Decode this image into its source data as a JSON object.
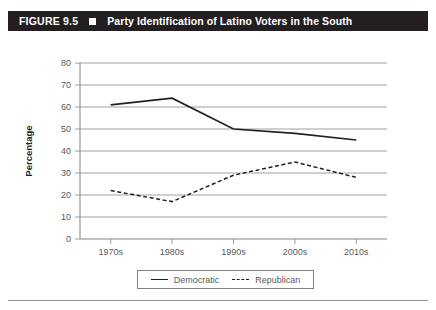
{
  "figure": {
    "number_label": "FIGURE 9.5",
    "separator_icon": "white-square-icon",
    "title": "Party Identification of Latino Voters in the South"
  },
  "legend": {
    "items": [
      {
        "label": "Democratic",
        "style": "solid",
        "swatch_icon": "solid-line-swatch-icon"
      },
      {
        "label": "Republican",
        "style": "dashed",
        "swatch_icon": "dashed-line-swatch-icon"
      }
    ]
  },
  "chart_data": {
    "type": "line",
    "title": "Party Identification of Latino Voters in the South",
    "xlabel": "",
    "ylabel": "Percentage",
    "categories": [
      "1970s",
      "1980s",
      "1990s",
      "2000s",
      "2010s"
    ],
    "series": [
      {
        "name": "Democratic",
        "style": "solid",
        "values": [
          61,
          64,
          50,
          48,
          45
        ]
      },
      {
        "name": "Republican",
        "style": "dashed",
        "values": [
          22,
          17,
          29,
          35,
          28
        ]
      }
    ],
    "ylim": [
      0,
      80
    ],
    "yticks": [
      0,
      10,
      20,
      30,
      40,
      50,
      60,
      70,
      80
    ],
    "ytick_labels": [
      "0",
      "10",
      "20",
      "30",
      "40",
      "50",
      "60",
      "70",
      "80"
    ],
    "grid": true,
    "grid_axis": "y",
    "legend_position": "bottom",
    "colors": {
      "line": "#231f20",
      "grid": "#939598",
      "axis_text": "#58595b",
      "title_bar": "#231f20",
      "background": "#ffffff"
    }
  }
}
